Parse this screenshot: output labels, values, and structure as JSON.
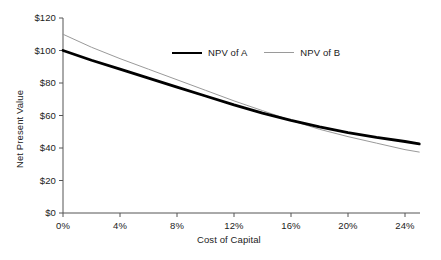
{
  "chart_data": {
    "type": "line",
    "title": "",
    "xlabel": "Cost of Capital",
    "ylabel": "Net Present Value",
    "xlim": [
      0,
      26
    ],
    "ylim": [
      0,
      120
    ],
    "xticks": [
      "0%",
      "4%",
      "8%",
      "12%",
      "16%",
      "20%",
      "24%"
    ],
    "xtick_values": [
      0,
      4,
      8,
      12,
      16,
      20,
      24
    ],
    "yticks": [
      "$0",
      "$20",
      "$40",
      "$60",
      "$80",
      "$100",
      "$120"
    ],
    "ytick_values": [
      0,
      20,
      40,
      60,
      80,
      100,
      120
    ],
    "grid": false,
    "legend_position": "top-center",
    "x": [
      0,
      2,
      4,
      6,
      8,
      10,
      12,
      14,
      16,
      18,
      20,
      22,
      24,
      25
    ],
    "series": [
      {
        "name": "NPV of A",
        "color": "#000000",
        "width": 2.8,
        "values": [
          100,
          94,
          88.5,
          83,
          77.5,
          72,
          66.5,
          61.5,
          57,
          53,
          49.5,
          46.5,
          44,
          42.5
        ]
      },
      {
        "name": "NPV of B",
        "color": "#9a9a9a",
        "width": 1.0,
        "values": [
          110,
          102,
          95,
          88.5,
          82,
          75.5,
          69,
          63,
          57,
          51.5,
          47,
          43,
          39,
          37.5
        ]
      }
    ],
    "crossover": {
      "x": 12.5,
      "y": 66
    }
  },
  "legend": {
    "items": [
      {
        "label": "NPV of A"
      },
      {
        "label": "NPV of B"
      }
    ]
  },
  "colors": {
    "series_a": "#000000",
    "series_b": "#9a9a9a",
    "axis": "#555555",
    "text": "#1a1a1a",
    "background": "#ffffff"
  }
}
